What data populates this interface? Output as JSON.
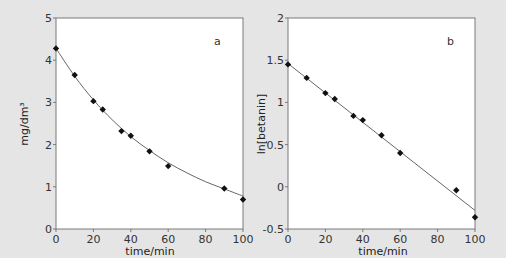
{
  "colors": {
    "background": "#e5e5e5",
    "plot_area": "#ffffff",
    "axis": "#7a7a7a",
    "fit_line": "#666666",
    "marker": "#111111"
  },
  "chart_data": [
    {
      "type": "scatter",
      "panel_label": "a",
      "title": "",
      "xlabel": "time/min",
      "ylabel": "mg/dm³",
      "xlim": [
        0,
        100
      ],
      "ylim": [
        0,
        5
      ],
      "xticks": [
        0,
        20,
        40,
        60,
        80,
        100
      ],
      "yticks": [
        0,
        1,
        2,
        3,
        4,
        5
      ],
      "grid": false,
      "legend": null,
      "series": [
        {
          "name": "measured",
          "marker": "diamond",
          "x": [
            0,
            10,
            20,
            25,
            35,
            40,
            50,
            60,
            90,
            100
          ],
          "y": [
            4.28,
            3.65,
            3.03,
            2.83,
            2.32,
            2.21,
            1.84,
            1.49,
            0.96,
            0.7
          ]
        },
        {
          "name": "exponential fit",
          "style": "line",
          "x": [
            0,
            10,
            20,
            30,
            40,
            50,
            60,
            70,
            80,
            90,
            100
          ],
          "y": [
            4.28,
            3.62,
            3.06,
            2.59,
            2.19,
            1.86,
            1.57,
            1.33,
            1.12,
            0.95,
            0.78
          ]
        }
      ]
    },
    {
      "type": "scatter",
      "panel_label": "b",
      "title": "",
      "xlabel": "time/min",
      "ylabel": "ln[betanin]",
      "xlim": [
        0,
        100
      ],
      "ylim": [
        -0.5,
        2
      ],
      "xticks": [
        0,
        20,
        40,
        60,
        80,
        100
      ],
      "yticks": [
        -0.5,
        0,
        0.5,
        1,
        1.5,
        2
      ],
      "grid": false,
      "legend": null,
      "series": [
        {
          "name": "measured",
          "marker": "diamond",
          "x": [
            0,
            10,
            20,
            25,
            35,
            40,
            50,
            60,
            90,
            100
          ],
          "y": [
            1.45,
            1.29,
            1.11,
            1.04,
            0.84,
            0.79,
            0.61,
            0.4,
            -0.04,
            -0.36
          ]
        },
        {
          "name": "linear fit",
          "style": "line",
          "x": [
            0,
            100
          ],
          "y": [
            1.46,
            -0.28
          ]
        }
      ]
    }
  ],
  "panels": [
    {
      "letter": "a",
      "xlabel": "time/min",
      "ylabel": "mg/dm³",
      "xtick_labels": [
        "0",
        "20",
        "40",
        "60",
        "80",
        "100"
      ],
      "ytick_labels": [
        "0",
        "1",
        "2",
        "3",
        "4",
        "5"
      ]
    },
    {
      "letter": "b",
      "xlabel": "time/min",
      "ylabel": "ln[betanin]",
      "xtick_labels": [
        "0",
        "20",
        "40",
        "60",
        "80",
        "100"
      ],
      "ytick_labels": [
        "-0.5",
        "0",
        "0.5",
        "1",
        "1.5",
        "2"
      ]
    }
  ]
}
